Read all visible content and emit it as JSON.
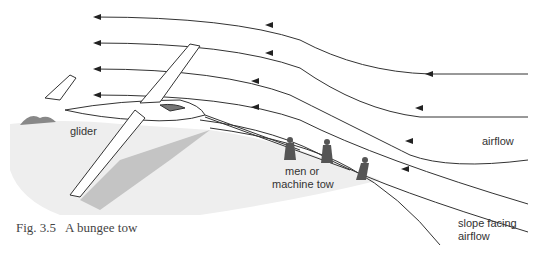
{
  "figure": {
    "caption": "Fig. 3.5   A bungee tow",
    "labels": {
      "glider": "glider",
      "tow_line1": "men or",
      "tow_line2": "machine tow",
      "airflow": "airflow",
      "slope_line1": "slope facing",
      "slope_line2": "airflow"
    }
  },
  "colors": {
    "line": "#333333",
    "shadow": "#b8b8b8",
    "ground": "#e6e6e6"
  }
}
